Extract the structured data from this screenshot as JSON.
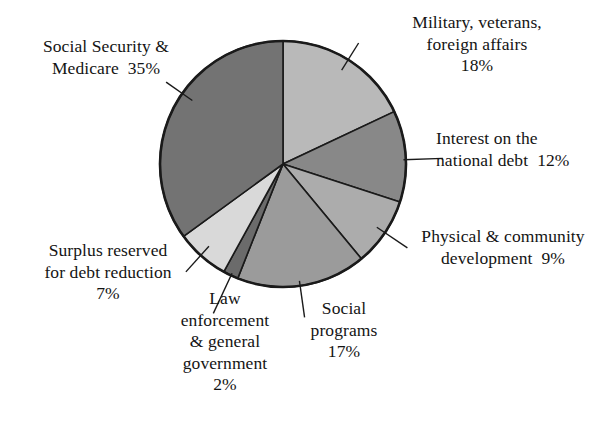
{
  "figure": {
    "background_color": "#ffffff",
    "outline_color": "#1a1a1a"
  },
  "chart_data": {
    "type": "pie",
    "title": "",
    "subtitle": "",
    "xlabel": "",
    "ylabel": "",
    "legend_position": "none",
    "grid": false,
    "units": "percent",
    "start_angle_deg": 0,
    "direction": "clockwise",
    "center": {
      "x": 283,
      "y": 164,
      "radius": 123
    },
    "categories": [
      "Military, veterans, foreign affairs",
      "Interest on the national debt",
      "Physical & community development",
      "Social programs",
      "Law enforcement & general government",
      "Surplus reserved for debt reduction",
      "Social Security & Medicare"
    ],
    "values": [
      18,
      12,
      9,
      17,
      2,
      7,
      35
    ],
    "colors": [
      "#b9b9b9",
      "#888888",
      "#acacac",
      "#9b9b9b",
      "#6b6b6b",
      "#d9d9d9",
      "#737373"
    ],
    "slices": [
      {
        "key": "military",
        "name": "Military, veterans, foreign affairs",
        "value": 18,
        "value_label": "18%",
        "color": "#b9b9b9",
        "start_deg": 0,
        "end_deg": 64.8,
        "label_lines": [
          "Military, veterans,",
          "foreign affairs",
          "18%"
        ]
      },
      {
        "key": "interest",
        "name": "Interest on the national debt",
        "value": 12,
        "value_label": "12%",
        "color": "#888888",
        "start_deg": 64.8,
        "end_deg": 108.0,
        "label_lines": [
          "Interest on the",
          "national debt  12%"
        ]
      },
      {
        "key": "physical",
        "name": "Physical & community development",
        "value": 9,
        "value_label": "9%",
        "color": "#acacac",
        "start_deg": 108.0,
        "end_deg": 140.4,
        "label_lines": [
          "Physical & community",
          "development  9%"
        ]
      },
      {
        "key": "social-programs",
        "name": "Social programs",
        "value": 17,
        "value_label": "17%",
        "color": "#9b9b9b",
        "start_deg": 140.4,
        "end_deg": 201.6,
        "label_lines": [
          "Social",
          "programs",
          "17%"
        ]
      },
      {
        "key": "law-enforcement",
        "name": "Law enforcement & general government",
        "value": 2,
        "value_label": "2%",
        "color": "#6b6b6b",
        "start_deg": 201.6,
        "end_deg": 208.8,
        "label_lines": [
          "Law",
          "enforcement",
          "& general",
          "government",
          "2%"
        ]
      },
      {
        "key": "surplus",
        "name": "Surplus reserved for debt reduction",
        "value": 7,
        "value_label": "7%",
        "color": "#d9d9d9",
        "start_deg": 208.8,
        "end_deg": 234.0,
        "label_lines": [
          "Surplus reserved",
          "for debt reduction",
          "7%"
        ]
      },
      {
        "key": "social-security",
        "name": "Social Security & Medicare",
        "value": 35,
        "value_label": "35%",
        "color": "#737373",
        "start_deg": 234.0,
        "end_deg": 360.0,
        "label_lines": [
          "Social Security &",
          "Medicare  35%"
        ]
      }
    ]
  },
  "labels": {
    "social_security": "Social Security &\nMedicare  35%",
    "military": "Military, veterans,\nforeign affairs\n18%",
    "interest": "Interest on the\nnational debt  12%",
    "physical": "Physical & community\ndevelopment  9%",
    "social_programs": "Social\nprograms\n17%",
    "law_enforcement": "Law\nenforcement\n& general\ngovernment\n2%",
    "surplus": "Surplus reserved\nfor debt reduction\n7%"
  }
}
